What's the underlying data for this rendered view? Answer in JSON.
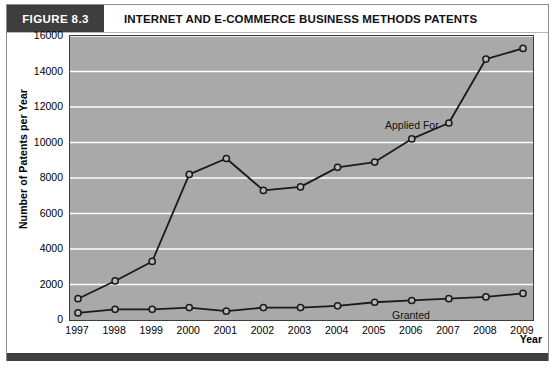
{
  "figure": {
    "tag": "FIGURE 8.3",
    "title": "INTERNET AND E-COMMERCE BUSINESS METHODS PATENTS"
  },
  "colors": {
    "tag_background": "#3e3e3e",
    "plot_background": "#a9a9a9",
    "gridline": "#ffffff",
    "line": "#1a1a1a",
    "marker_fill": "#b8b8b8",
    "frame_border": "#8c8c8c"
  },
  "chart_data": {
    "type": "line",
    "title": "INTERNET AND E-COMMERCE BUSINESS METHODS PATENTS",
    "xlabel": "Year",
    "ylabel": "Number of Patents per Year",
    "categories": [
      "1997",
      "1998",
      "1999",
      "2000",
      "2001",
      "2002",
      "2003",
      "2004",
      "2005",
      "2006",
      "2007",
      "2008",
      "2009"
    ],
    "ylim": [
      0,
      16000
    ],
    "ytick_labels": [
      "16000",
      "14000",
      "12000",
      "10000",
      "8000",
      "6000",
      "4000",
      "2000",
      "0"
    ],
    "ytick_values": [
      16000,
      14000,
      12000,
      10000,
      8000,
      6000,
      4000,
      2000,
      0
    ],
    "grid": "horizontal",
    "legend_position": "inline-annotation",
    "series": [
      {
        "name": "Applied For",
        "values": [
          1200,
          2200,
          3300,
          8200,
          9100,
          7300,
          7500,
          8600,
          8900,
          10200,
          11100,
          14700,
          15300
        ]
      },
      {
        "name": "Granted",
        "values": [
          400,
          600,
          600,
          700,
          500,
          700,
          700,
          800,
          1000,
          1100,
          1200,
          1300,
          1500
        ]
      }
    ],
    "annotations": [
      {
        "text": "Applied For",
        "x_px": 378,
        "y_px": 86
      },
      {
        "text": "Granted",
        "x_px": 385,
        "y_px": 276
      }
    ]
  }
}
